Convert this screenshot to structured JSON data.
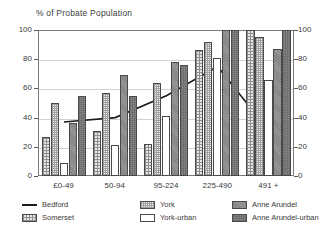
{
  "chart_data": {
    "type": "bar",
    "title": "% of Probate Population",
    "xlabel": "",
    "ylabel": "% of Probate Population",
    "ylim": [
      0,
      100
    ],
    "y_ticks": [
      0,
      20,
      40,
      60,
      80,
      100
    ],
    "y_ticks_right": [
      0,
      20,
      40,
      60,
      80,
      100
    ],
    "grid": true,
    "legend_position": "below",
    "categories": [
      "£0-49",
      "50-94",
      "95-224",
      "225-490",
      "491 +"
    ],
    "series": [
      {
        "name": "Somerset",
        "type": "bar",
        "values": [
          27,
          31,
          22,
          86,
          100
        ]
      },
      {
        "name": "York",
        "type": "bar",
        "values": [
          50,
          57,
          64,
          92,
          95
        ]
      },
      {
        "name": "York-urban",
        "type": "bar",
        "values": [
          9,
          21,
          41,
          81,
          66
        ]
      },
      {
        "name": "Anne Arundel",
        "type": "bar",
        "values": [
          36,
          69,
          78,
          100,
          87
        ]
      },
      {
        "name": "Anne Arundel-urban",
        "type": "bar",
        "values": [
          55,
          55,
          76,
          100,
          100
        ]
      },
      {
        "name": "Bedford",
        "type": "line",
        "values": [
          37,
          40,
          55,
          75,
          31
        ]
      }
    ]
  },
  "legend": {
    "entries": [
      {
        "label": "Bedford",
        "marker": "line",
        "pattern": "solid-line"
      },
      {
        "label": "Somerset",
        "marker": "swatch",
        "pattern": "grid-hatch"
      },
      {
        "label": "York",
        "marker": "swatch",
        "pattern": "fine-grid-hatch"
      },
      {
        "label": "York-urban",
        "marker": "swatch",
        "pattern": "empty"
      },
      {
        "label": "Anne Arundel",
        "marker": "swatch",
        "pattern": "dark-stipple"
      },
      {
        "label": "Anne Arundel-urban",
        "marker": "swatch",
        "pattern": "dark-grid"
      }
    ]
  },
  "colors": {
    "axis": "#7a7a7a",
    "grid": "#d2d2d2",
    "text": "#3a3a3a",
    "line": "#1c1c1c",
    "bar_border": "#4a4a4a"
  }
}
